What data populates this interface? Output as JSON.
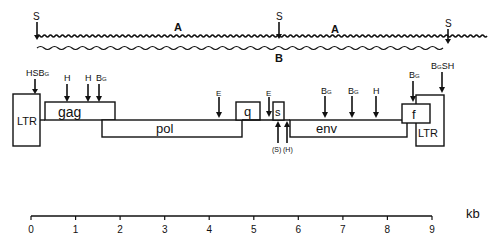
{
  "top_map": {
    "site_labels": [
      {
        "text": "S",
        "x": 37
      },
      {
        "text": "S",
        "x": 279
      },
      {
        "text": "S",
        "x": 448
      }
    ],
    "fragment_a_labels": [
      "A",
      "A"
    ],
    "fragment_b_label": "B"
  },
  "genome": {
    "blocks": [
      {
        "id": "ltr-left",
        "label": "LTR"
      },
      {
        "id": "gag",
        "label": "gag"
      },
      {
        "id": "pol",
        "label": "pol"
      },
      {
        "id": "q",
        "label": "q"
      },
      {
        "id": "s",
        "label": "s"
      },
      {
        "id": "env",
        "label": "env"
      },
      {
        "id": "f",
        "label": "f"
      },
      {
        "id": "ltr-right",
        "label": "LTR"
      }
    ],
    "sites_above": [
      {
        "label": "HSB",
        "sub": "G",
        "x": 35
      },
      {
        "label": "H",
        "x": 67
      },
      {
        "label": "H",
        "x": 88
      },
      {
        "label": "B",
        "sub": "G",
        "x": 99
      },
      {
        "label": "E",
        "x": 219
      },
      {
        "label": "E",
        "x": 269
      },
      {
        "label": "B",
        "sub": "G",
        "x": 325
      },
      {
        "label": "B",
        "sub": "G",
        "x": 352
      },
      {
        "label": "H",
        "x": 376
      },
      {
        "label": "B",
        "sub": "G",
        "x": 413
      },
      {
        "label": "B",
        "sub": "G",
        "label2": "SH",
        "x": 442
      }
    ],
    "sites_below": [
      {
        "label": "(S)",
        "x": 278
      },
      {
        "label": "(H)",
        "x": 287
      }
    ]
  },
  "scale": {
    "ticks": [
      "0",
      "1",
      "2",
      "3",
      "4",
      "5",
      "6",
      "7",
      "8",
      "9"
    ],
    "unit": "kb"
  }
}
